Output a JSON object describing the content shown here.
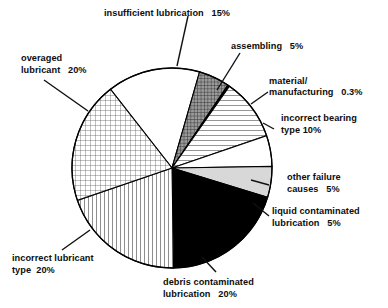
{
  "chart_data": {
    "type": "pie",
    "title": "",
    "total_label": "",
    "legend_position": "callout-labels",
    "categories": [
      "insufficient lubrication",
      "assembling",
      "material/ manufacturing",
      "incorrect bearing type",
      "other failure causes",
      "liquid contaminated lubrication",
      "debris contaminated lubrication",
      "incorrect lubricant type",
      "overaged lubricant"
    ],
    "values": [
      15,
      5,
      0.3,
      10,
      5,
      5,
      20,
      20,
      20
    ],
    "value_labels": [
      "15%",
      "5%",
      "0.3%",
      "10%",
      "5%",
      "5%",
      "20%",
      "20%",
      "20%"
    ],
    "slices": [
      {
        "name": "insufficient lubrication",
        "value": 15,
        "value_label": "15%",
        "fill": "white",
        "start": -38.0,
        "end": 16.0
      },
      {
        "name": "assembling",
        "value": 5,
        "value_label": "5%",
        "fill": "darkgrid",
        "start": 16.0,
        "end": 34.0
      },
      {
        "name": "material/ manufacturing",
        "value": 0.3,
        "value_label": "0.3%",
        "fill": "black",
        "start": 34.0,
        "end": 35.1
      },
      {
        "name": "incorrect bearing type",
        "value": 10,
        "value_label": "10%",
        "fill": "hlines",
        "start": 35.1,
        "end": 71.1
      },
      {
        "name": "other failure causes",
        "value": 5,
        "value_label": "5%",
        "fill": "white",
        "start": 71.1,
        "end": 89.1
      },
      {
        "name": "liquid contaminated lubrication",
        "value": 5,
        "value_label": "5%",
        "fill": "lightgray",
        "start": 89.1,
        "end": 107.1
      },
      {
        "name": "debris contaminated lubrication",
        "value": 20,
        "value_label": "20%",
        "fill": "black",
        "start": 107.1,
        "end": 179.1
      },
      {
        "name": "incorrect lubricant type",
        "value": 20,
        "value_label": "20%",
        "fill": "vlines",
        "start": 179.1,
        "end": 251.1
      },
      {
        "name": "overaged lubricant",
        "value": 20,
        "value_label": "20%",
        "fill": "grid",
        "start": 251.1,
        "end": 322.0
      }
    ],
    "geometry": {
      "cx": 172,
      "cy": 168,
      "r": 100
    },
    "colors": {
      "outline": "#000000",
      "black_slice": "#000000",
      "white_slice": "#ffffff",
      "light_gray_slice": "#d8d8d8",
      "dark_grid_slice": "#8c8c8c"
    }
  },
  "labels": {
    "insufficient_lubrication": {
      "line1": "insufficient lubrication   15%"
    },
    "assembling": {
      "line1": "assembling   5%"
    },
    "material_manufacturing": {
      "line1": "material/",
      "line2": "manufacturing   0.3%"
    },
    "incorrect_bearing_type": {
      "line1": "incorrect bearing",
      "line2": "type 10%"
    },
    "other_failure_causes": {
      "line1": "other failure",
      "line2": "causes   5%"
    },
    "liquid_contaminated": {
      "line1": "liquid contaminated",
      "line2": "lubrication   5%"
    },
    "debris_contaminated": {
      "line1": "debris contaminated",
      "line2": "lubrication   20%"
    },
    "incorrect_lubricant_type": {
      "line1": "incorrect lubricant",
      "line2": "type  20%"
    },
    "overaged_lubricant": {
      "line1": "overaged",
      "line2": "lubricant   20%"
    }
  }
}
